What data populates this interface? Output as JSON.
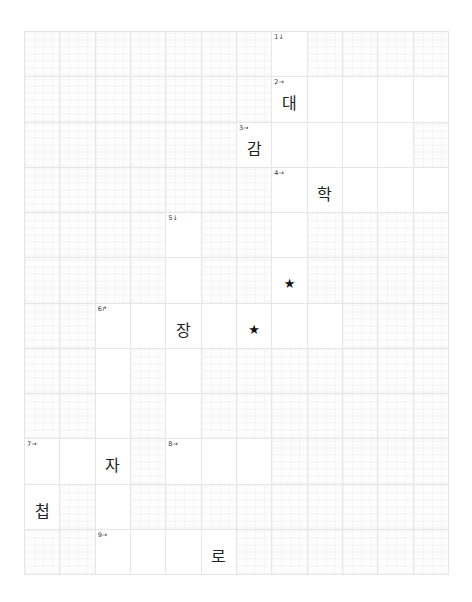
{
  "puzzle": {
    "rows": 12,
    "cols": 12,
    "active_cells": [
      [
        0,
        7
      ],
      [
        1,
        7
      ],
      [
        1,
        8
      ],
      [
        1,
        9
      ],
      [
        1,
        10
      ],
      [
        1,
        11
      ],
      [
        2,
        6
      ],
      [
        2,
        7
      ],
      [
        2,
        8
      ],
      [
        2,
        9
      ],
      [
        2,
        10
      ],
      [
        3,
        7
      ],
      [
        3,
        8
      ],
      [
        3,
        9
      ],
      [
        3,
        10
      ],
      [
        3,
        11
      ],
      [
        4,
        4
      ],
      [
        4,
        7
      ],
      [
        5,
        4
      ],
      [
        5,
        7
      ],
      [
        6,
        2
      ],
      [
        6,
        3
      ],
      [
        6,
        4
      ],
      [
        6,
        5
      ],
      [
        6,
        6
      ],
      [
        6,
        7
      ],
      [
        6,
        8
      ],
      [
        7,
        2
      ],
      [
        7,
        4
      ],
      [
        8,
        2
      ],
      [
        8,
        4
      ],
      [
        9,
        0
      ],
      [
        9,
        1
      ],
      [
        9,
        2
      ],
      [
        9,
        4
      ],
      [
        9,
        5
      ],
      [
        9,
        6
      ],
      [
        10,
        0
      ],
      [
        10,
        2
      ],
      [
        11,
        2
      ],
      [
        11,
        3
      ],
      [
        11,
        4
      ],
      [
        11,
        5
      ]
    ],
    "clues": [
      {
        "row": 0,
        "col": 7,
        "label": "1↓"
      },
      {
        "row": 1,
        "col": 7,
        "label": "2→"
      },
      {
        "row": 2,
        "col": 6,
        "label": "3→"
      },
      {
        "row": 3,
        "col": 7,
        "label": "4→"
      },
      {
        "row": 4,
        "col": 4,
        "label": "5↓"
      },
      {
        "row": 6,
        "col": 2,
        "label": "6↱"
      },
      {
        "row": 9,
        "col": 0,
        "label": "7→"
      },
      {
        "row": 9,
        "col": 4,
        "label": "8→"
      },
      {
        "row": 11,
        "col": 2,
        "label": "9→"
      }
    ],
    "letters": [
      {
        "row": 1,
        "col": 7,
        "char": "대"
      },
      {
        "row": 2,
        "col": 6,
        "char": "감"
      },
      {
        "row": 3,
        "col": 8,
        "char": "학"
      },
      {
        "row": 6,
        "col": 4,
        "char": "장"
      },
      {
        "row": 9,
        "col": 2,
        "char": "자"
      },
      {
        "row": 10,
        "col": 0,
        "char": "첩"
      },
      {
        "row": 11,
        "col": 5,
        "char": "로"
      }
    ],
    "stars": [
      {
        "row": 5,
        "col": 7,
        "symbol": "★"
      },
      {
        "row": 6,
        "col": 6,
        "symbol": "★"
      }
    ]
  }
}
